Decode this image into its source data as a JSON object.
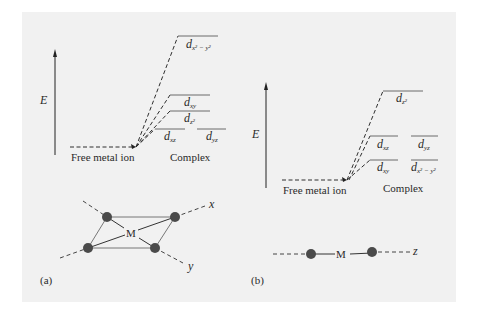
{
  "figure": {
    "background": "#f1f1f1",
    "panel_a": {
      "tag": "(a)",
      "energy_label": "E",
      "free_ion_label": "Free metal ion",
      "complex_label": "Complex",
      "levels": [
        {
          "orbital": "d",
          "subscript": "x² − y²",
          "rank": 1
        },
        {
          "orbital": "d",
          "subscript": "xy",
          "rank": 2
        },
        {
          "orbital": "d",
          "subscript": "z²",
          "rank": 3
        },
        {
          "orbital": "d",
          "subscript": "xz",
          "rank": 4
        },
        {
          "orbital": "d",
          "subscript": "yz",
          "rank": 4
        }
      ],
      "geometry": {
        "name": "square planar",
        "center_label": "M",
        "axis_labels": [
          "x",
          "y"
        ]
      }
    },
    "panel_b": {
      "tag": "(b)",
      "energy_label": "E",
      "free_ion_label": "Free metal ion",
      "complex_label": "Complex",
      "levels": [
        {
          "orbital": "d",
          "subscript": "z²",
          "rank": 1
        },
        {
          "orbital": "d",
          "subscript": "xz",
          "rank": 2
        },
        {
          "orbital": "d",
          "subscript": "yz",
          "rank": 2
        },
        {
          "orbital": "d",
          "subscript": "xy",
          "rank": 3
        },
        {
          "orbital": "d",
          "subscript": "x² − y²",
          "rank": 3
        }
      ],
      "geometry": {
        "name": "linear",
        "center_label": "M",
        "axis_labels": [
          "z"
        ]
      }
    }
  }
}
